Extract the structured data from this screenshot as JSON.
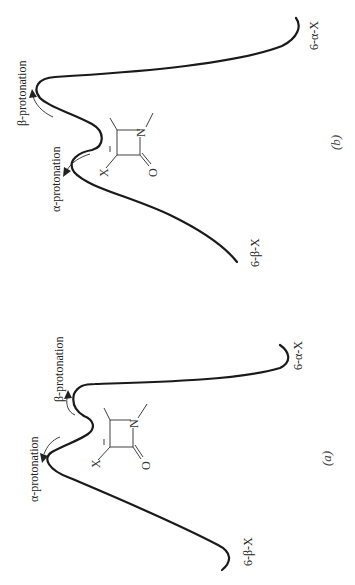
{
  "figure": {
    "orientation": "rotated 90 degrees counter-clockwise",
    "panels": [
      {
        "id": "b",
        "label": "(b)",
        "left_end_label": "6-β-X",
        "right_end_label": "6-α-X",
        "alpha_arrow_label": "α-protonation",
        "beta_arrow_label": "β-protonation",
        "description": "Energy profile: carbanion intermediate in shallow well; α-protonation barrier lower than β-protonation barrier"
      },
      {
        "id": "a",
        "label": "(a)",
        "left_end_label": "6-β-X",
        "right_end_label": "6-α-X",
        "alpha_arrow_label": "α-protonation",
        "beta_arrow_label": "β-protonation",
        "description": "Energy profile: carbanion intermediate in well; α-protonation barrier higher than β-protonation barrier"
      }
    ],
    "structure": {
      "substituent": "X",
      "heteroatom": "N",
      "carbonyl": "O",
      "charge": "−",
      "ring": "β-lactam (azetidinone) carbanion"
    }
  }
}
